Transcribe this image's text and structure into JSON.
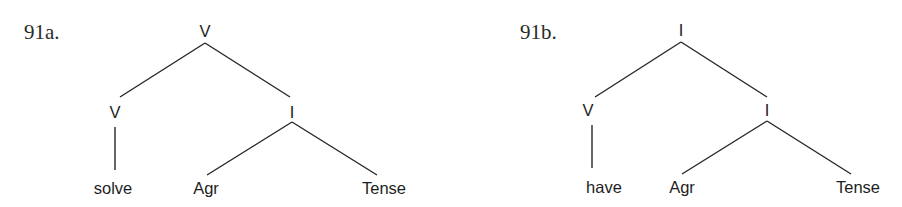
{
  "figure": {
    "trees": [
      {
        "label": "91a.",
        "root": "V",
        "left_child": "V",
        "left_leaf": "solve",
        "right_child": "I",
        "right_left_leaf": "Agr",
        "right_right_leaf": "Tense"
      },
      {
        "label": "91b.",
        "root": "I",
        "left_child": "V",
        "left_leaf": "have",
        "right_child": "I",
        "right_left_leaf": "Agr",
        "right_right_leaf": "Tense"
      }
    ]
  }
}
